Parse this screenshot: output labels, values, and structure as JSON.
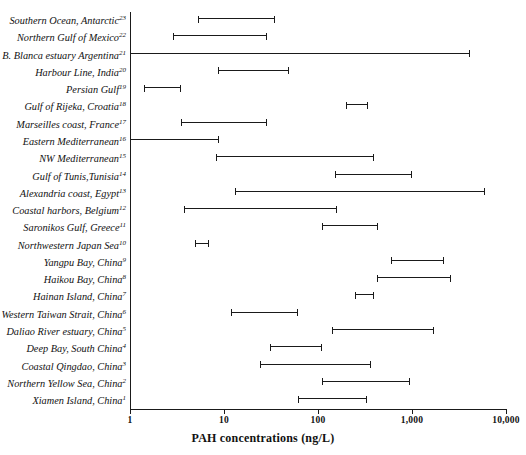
{
  "chart_data": {
    "type": "bar",
    "orientation": "horizontal-range",
    "title": "",
    "xlabel": "PAH concentrations (ng/L)",
    "ylabel": "",
    "xscale": "log",
    "xlim": [
      1,
      10000
    ],
    "xticks": [
      1,
      10,
      100,
      1000,
      10000
    ],
    "xticklabels": [
      "1",
      "10",
      "100",
      "1,000",
      "10,000"
    ],
    "grid": false,
    "legend": null,
    "categories": [
      "Southern Ocean, Antarctic",
      "Northern Gulf of Mexico",
      "B. Blanca estuary Argentina",
      "Harbour Line, India",
      "Persian Gulf",
      "Gulf of Rijeka, Croatia",
      "Marseilles coast, France",
      "Eastern Mediterranean",
      "NW Mediterranean",
      "Gulf of Tunis,Tunisia",
      "Alexandria coast, Egypt",
      "Coastal harbors, Belgium",
      "Saronikos Gulf, Greece",
      "Northwestern Japan Sea",
      "Yangpu Bay, China",
      "Haikou Bay, China",
      "Hainan Island, China",
      "Western Taiwan Strait, China",
      "Daliao River estuary, China",
      "Deep Bay, South China",
      "Coastal Qingdao, China",
      "Northern Yellow Sea, China",
      "Xiamen Island, China"
    ],
    "refs": [
      23,
      22,
      21,
      20,
      19,
      18,
      17,
      16,
      15,
      14,
      13,
      12,
      11,
      10,
      9,
      8,
      7,
      6,
      5,
      4,
      3,
      2,
      1
    ],
    "ranges": [
      {
        "label": "Southern Ocean, Antarctic",
        "ref": 23,
        "low": 5.3,
        "high": 35
      },
      {
        "label": "Northern Gulf of Mexico",
        "ref": 22,
        "low": 2.9,
        "high": 29
      },
      {
        "label": "B. Blanca estuary Argentina",
        "ref": 21,
        "low": 1.0,
        "high": 4100
      },
      {
        "label": "Harbour Line, India",
        "ref": 20,
        "low": 8.6,
        "high": 49
      },
      {
        "label": "Persian Gulf",
        "ref": 19,
        "low": 1.4,
        "high": 3.5
      },
      {
        "label": "Gulf of Rijeka, Croatia",
        "ref": 18,
        "low": 200,
        "high": 340
      },
      {
        "label": "Marseilles coast, France",
        "ref": 17,
        "low": 3.5,
        "high": 29
      },
      {
        "label": "Eastern Mediterranean",
        "ref": 16,
        "low": 1.0,
        "high": 8.9
      },
      {
        "label": "NW Mediterranean",
        "ref": 15,
        "low": 8.2,
        "high": 390
      },
      {
        "label": "Gulf of Tunis,Tunisia",
        "ref": 14,
        "low": 150,
        "high": 1000
      },
      {
        "label": "Alexandria coast, Egypt",
        "ref": 13,
        "low": 13,
        "high": 6000
      },
      {
        "label": "Coastal harbors, Belgium",
        "ref": 12,
        "low": 3.8,
        "high": 160
      },
      {
        "label": "Saronikos Gulf, Greece",
        "ref": 11,
        "low": 110,
        "high": 430
      },
      {
        "label": "Northwestern Japan Sea",
        "ref": 10,
        "low": 4.9,
        "high": 6.9
      },
      {
        "label": "Yangpu Bay, China",
        "ref": 9,
        "low": 600,
        "high": 2200
      },
      {
        "label": "Haikou Bay, China",
        "ref": 8,
        "low": 420,
        "high": 2600
      },
      {
        "label": "Hainan Island, China",
        "ref": 7,
        "low": 250,
        "high": 390
      },
      {
        "label": "Western Taiwan Strait, China",
        "ref": 6,
        "low": 12,
        "high": 62
      },
      {
        "label": "Daliao River estuary, China",
        "ref": 5,
        "low": 140,
        "high": 1700
      },
      {
        "label": "Deep Bay, South China",
        "ref": 4,
        "low": 31,
        "high": 110
      },
      {
        "label": "Coastal Qingdao, China",
        "ref": 3,
        "low": 24,
        "high": 370
      },
      {
        "label": "Northern Yellow Sea, China",
        "ref": 2,
        "low": 110,
        "high": 960
      },
      {
        "label": "Xiamen Island, China",
        "ref": 1,
        "low": 62,
        "high": 330
      }
    ]
  },
  "colors": {
    "line": "#1a1a1a",
    "background": "#ffffff"
  }
}
